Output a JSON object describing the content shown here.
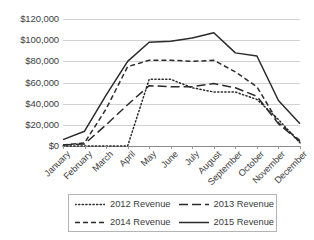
{
  "chart_data": {
    "type": "line",
    "title": "",
    "xlabel": "",
    "ylabel": "",
    "ylim": [
      0,
      120000
    ],
    "ytick_values": [
      0,
      20000,
      40000,
      60000,
      80000,
      100000,
      120000
    ],
    "ytick_labels": [
      "$0",
      "$20,000",
      "$40,000",
      "$60,000",
      "$80,000",
      "$100,000",
      "$120,000"
    ],
    "grid": true,
    "legend_position": "bottom",
    "categories": [
      "January",
      "February",
      "March",
      "April",
      "May",
      "June",
      "July",
      "August",
      "September",
      "October",
      "November",
      "December"
    ],
    "series": [
      {
        "name": "2012 Revenue",
        "style": "dotted",
        "color": "#2b2b2b",
        "values": [
          0,
          0,
          0,
          0,
          63000,
          63000,
          55000,
          51000,
          51000,
          44000,
          25000,
          3000
        ]
      },
      {
        "name": "2013 Revenue",
        "style": "long-dash",
        "color": "#2b2b2b",
        "values": [
          1000,
          2000,
          20000,
          39000,
          57000,
          56000,
          56000,
          59000,
          55000,
          47000,
          21000,
          4000
        ]
      },
      {
        "name": "2014 Revenue",
        "style": "dashed",
        "color": "#2b2b2b",
        "values": [
          1000,
          3000,
          35000,
          75000,
          81000,
          81000,
          80000,
          81000,
          70000,
          56000,
          22000,
          5000
        ]
      },
      {
        "name": "2015 Revenue",
        "style": "solid",
        "color": "#2b2b2b",
        "values": [
          6000,
          14000,
          48000,
          80000,
          98000,
          99000,
          102000,
          107000,
          88000,
          85000,
          43000,
          21000
        ]
      }
    ]
  },
  "legend": {
    "items": [
      {
        "label": "2012 Revenue",
        "style": "dotted"
      },
      {
        "label": "2013 Revenue",
        "style": "long-dash"
      },
      {
        "label": "2014 Revenue",
        "style": "dashed"
      },
      {
        "label": "2015 Revenue",
        "style": "solid"
      }
    ]
  }
}
